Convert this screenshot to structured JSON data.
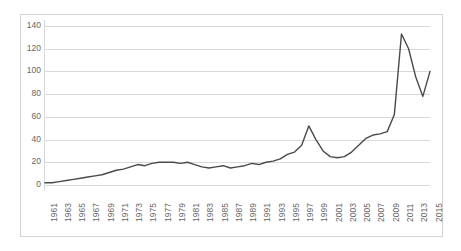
{
  "chart_data": {
    "type": "line",
    "title": "",
    "subtitle": "",
    "xlabel": "",
    "ylabel": "",
    "ylim": [
      0,
      140
    ],
    "yticks": [
      0,
      20,
      40,
      60,
      80,
      100,
      120,
      140
    ],
    "grid": true,
    "legend": false,
    "legend_position": "none",
    "line_color": "#4a4a4a",
    "gridline_color": "#d9d9d9",
    "border_color": "#d4d4d4",
    "tick_label_color": "#666666",
    "x_tick_rotation": -90,
    "x_tick_step": 2,
    "x": [
      1961,
      1962,
      1963,
      1964,
      1965,
      1966,
      1967,
      1968,
      1969,
      1970,
      1971,
      1972,
      1973,
      1974,
      1975,
      1976,
      1977,
      1978,
      1979,
      1980,
      1981,
      1982,
      1983,
      1984,
      1985,
      1986,
      1987,
      1988,
      1989,
      1990,
      1991,
      1992,
      1993,
      1994,
      1995,
      1996,
      1997,
      1998,
      1999,
      2000,
      2001,
      2002,
      2003,
      2004,
      2005,
      2006,
      2007,
      2008,
      2009,
      2010,
      2011,
      2012,
      2013,
      2014,
      2015
    ],
    "xticks": [
      1961,
      1963,
      1965,
      1967,
      1969,
      1971,
      1973,
      1975,
      1977,
      1979,
      1981,
      1983,
      1985,
      1987,
      1989,
      1991,
      1993,
      1995,
      1997,
      1999,
      2001,
      2003,
      2005,
      2007,
      2009,
      2011,
      2013,
      2015
    ],
    "xtick_labels": [
      "1961",
      "1963",
      "1965",
      "1967",
      "1969",
      "1971",
      "1973",
      "1975",
      "1977",
      "1979",
      "1981",
      "1983",
      "1985",
      "1987",
      "1989",
      "1991",
      "1993",
      "1995",
      "1997",
      "1999",
      "2001",
      "2003",
      "2005",
      "2007",
      "2009",
      "2011",
      "2013",
      "2015"
    ],
    "ytick_labels": [
      "0",
      "20",
      "40",
      "60",
      "80",
      "100",
      "120",
      "140"
    ],
    "series": [
      {
        "name": "series-1",
        "values": [
          2,
          2,
          3,
          4,
          5,
          6,
          7,
          8,
          9,
          11,
          13,
          14,
          16,
          18,
          17,
          19,
          20,
          20,
          20,
          19,
          20,
          18,
          16,
          15,
          16,
          17,
          15,
          16,
          17,
          19,
          18,
          20,
          21,
          23,
          27,
          29,
          35,
          52,
          40,
          30,
          25,
          24,
          25,
          29,
          35,
          41,
          44,
          45,
          47,
          62,
          133,
          120,
          95,
          78,
          100
        ]
      }
    ]
  }
}
